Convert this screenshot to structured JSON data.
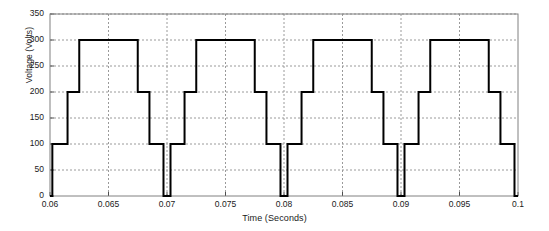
{
  "chart_data": {
    "type": "line",
    "subtype": "staircase-step",
    "title": "",
    "xlabel": "Time (Seconds)",
    "ylabel": "Voltage (Volts)",
    "xlim": [
      0.06,
      0.1
    ],
    "ylim": [
      0,
      350
    ],
    "xticks": [
      0.06,
      0.065,
      0.07,
      0.075,
      0.08,
      0.085,
      0.09,
      0.095,
      0.1
    ],
    "xtick_labels": [
      "0.06",
      "0.065",
      "0.07",
      "0.075",
      "0.08",
      "0.085",
      "0.09",
      "0.095",
      "0.1"
    ],
    "yticks": [
      0,
      50,
      100,
      150,
      200,
      250,
      300,
      350
    ],
    "ytick_labels": [
      "0",
      "50",
      "100",
      "150",
      "200",
      "250",
      "300",
      "350"
    ],
    "grid": true,
    "grid_style": "dotted",
    "grid_color": "#9a9a9a",
    "background": "#ffffff",
    "axis_color": "#808080",
    "legend": null,
    "series": [
      {
        "name": "Output Voltage",
        "color": "#000000",
        "line_width": 2,
        "step": "post",
        "period": 0.01,
        "levels": [
          0,
          100,
          200,
          300
        ],
        "x": [
          0.06,
          0.0602,
          0.0602,
          0.0615,
          0.0615,
          0.0625,
          0.0625,
          0.0675,
          0.0675,
          0.0685,
          0.0685,
          0.0697,
          0.0697,
          0.0703,
          0.0703,
          0.0715,
          0.0715,
          0.0725,
          0.0725,
          0.0775,
          0.0775,
          0.0785,
          0.0785,
          0.0797,
          0.0797,
          0.0803,
          0.0803,
          0.0815,
          0.0815,
          0.0825,
          0.0825,
          0.0875,
          0.0875,
          0.0885,
          0.0885,
          0.0897,
          0.0897,
          0.0903,
          0.0903,
          0.0915,
          0.0915,
          0.0925,
          0.0925,
          0.0975,
          0.0975,
          0.0985,
          0.0985,
          0.0997,
          0.0997,
          0.1
        ],
        "y": [
          0,
          0,
          100,
          100,
          200,
          200,
          300,
          300,
          200,
          200,
          100,
          100,
          0,
          0,
          100,
          100,
          200,
          200,
          300,
          300,
          200,
          200,
          100,
          100,
          0,
          0,
          100,
          100,
          200,
          200,
          300,
          300,
          200,
          200,
          100,
          100,
          0,
          0,
          100,
          100,
          200,
          200,
          300,
          300,
          200,
          200,
          100,
          100,
          0,
          0
        ]
      }
    ],
    "cycles_visible": 4
  }
}
